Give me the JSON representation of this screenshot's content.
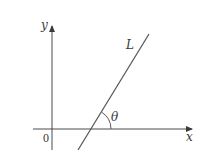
{
  "diagram": {
    "type": "coordinate-plane-line-angle",
    "labels": {
      "y_axis": "y",
      "x_axis": "x",
      "origin": "0",
      "line": "L",
      "angle": "θ"
    },
    "colors": {
      "axis": "#4a4a4a",
      "line": "#5a5a5a",
      "text": "#3a3a3a",
      "background": "#ffffff"
    }
  }
}
